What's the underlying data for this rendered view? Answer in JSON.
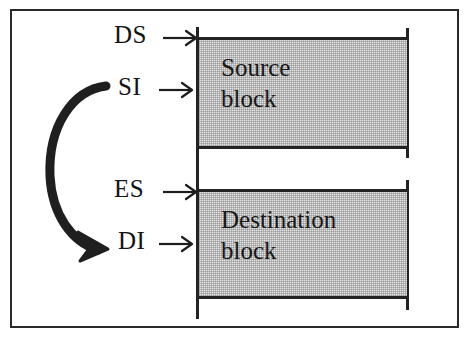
{
  "figure": {
    "border_color": "#2a2a2a",
    "line_color": "#232323",
    "block_fill": "#e3e3e3"
  },
  "pointers": [
    {
      "id": "ds",
      "label": "DS",
      "arrow_icon": "right-arrow-icon",
      "target": "source-block"
    },
    {
      "id": "si",
      "label": "SI",
      "arrow_icon": "right-arrow-icon",
      "target": "source-block"
    },
    {
      "id": "es",
      "label": "ES",
      "arrow_icon": "right-arrow-icon",
      "target": "destination-block"
    },
    {
      "id": "di",
      "label": "DI",
      "arrow_icon": "right-arrow-icon",
      "target": "destination-block"
    }
  ],
  "blocks": {
    "source": {
      "line1": "Source",
      "line2": "block"
    },
    "destination": {
      "line1": "Destination",
      "line2": "block"
    }
  },
  "copy_arrow": {
    "icon": "curved-arrow-icon",
    "from": "SI",
    "to": "DI"
  }
}
